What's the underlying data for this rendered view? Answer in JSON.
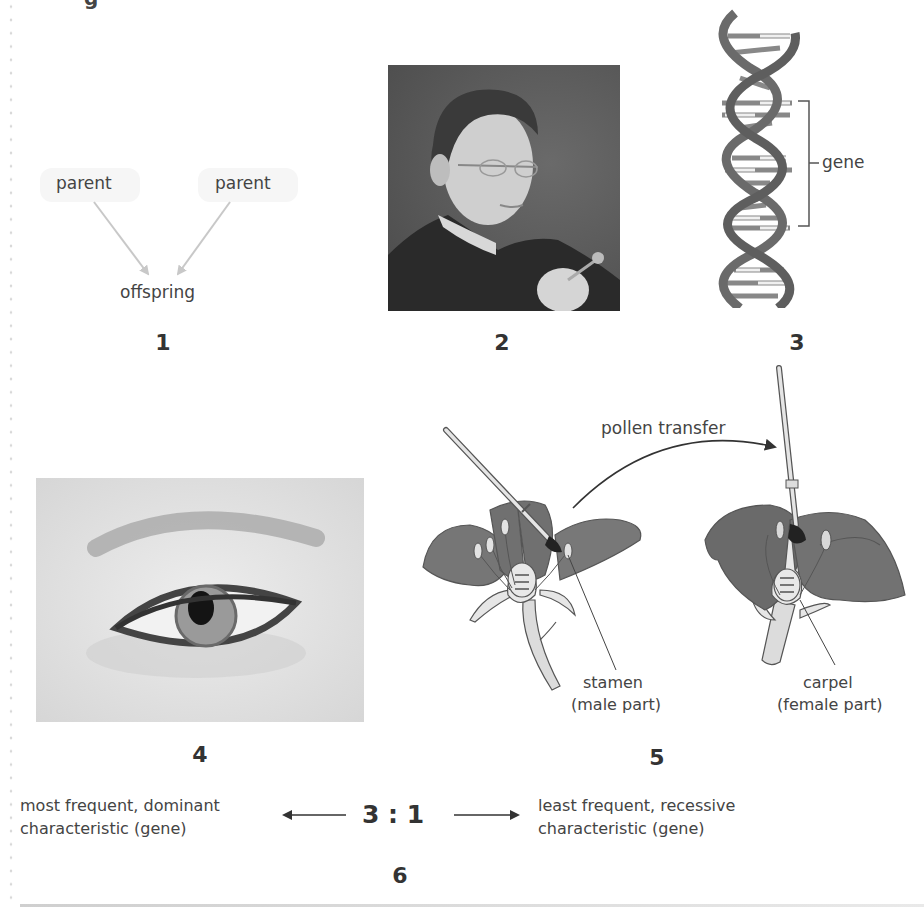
{
  "page": {
    "top_fragment": "g"
  },
  "panels": [
    {
      "number": "1",
      "labels": {
        "parent_left": "parent",
        "parent_right": "parent",
        "offspring": "offspring"
      }
    },
    {
      "number": "2",
      "image": "portrait-photo"
    },
    {
      "number": "3",
      "image": "dna-double-helix",
      "labels": {
        "gene": "gene"
      }
    },
    {
      "number": "4",
      "image": "eye-photo"
    },
    {
      "number": "5",
      "image": "flower-pollination",
      "labels": {
        "pollen_transfer": "pollen transfer",
        "stamen": "stamen",
        "stamen_note": "(male part)",
        "carpel": "carpel",
        "carpel_note": "(female part)"
      }
    },
    {
      "number": "6",
      "labels": {
        "ratio": "3 : 1",
        "left_line1": "most frequent, dominant",
        "left_line2": "characteristic (gene)",
        "right_line1": "least frequent, recessive",
        "right_line2": "characteristic (gene)"
      }
    }
  ],
  "colors": {
    "text": "#333333",
    "arrow_light": "#c8c8c8",
    "petal": "#6f6f6f",
    "helix": "#666666"
  }
}
